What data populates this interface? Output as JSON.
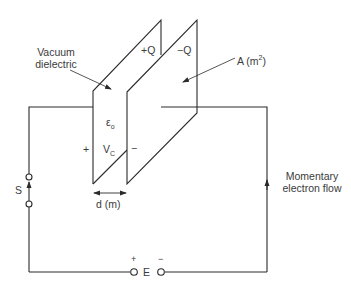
{
  "diagram": {
    "type": "parallel-plate capacitor circuit",
    "labels": {
      "dielectric_line1": "Vacuum",
      "dielectric_line2": "dielectric",
      "plate_pos_charge": "+Q",
      "plate_neg_charge": "−Q",
      "area": "A (m",
      "area_exp": "2",
      "area_close": ")",
      "permittivity": "ε",
      "permittivity_sub": "o",
      "plus_side": "+",
      "voltage": "V",
      "voltage_sub": "C",
      "minus_side": "−",
      "distance": "d (m)",
      "switch": "S",
      "source_plus": "+",
      "source": "E",
      "source_minus": "−",
      "flow_line1": "Momentary",
      "flow_line2": "electron flow"
    },
    "colors": {
      "line": "#2b2b2b",
      "text": "#3a3a3a",
      "background": "#ffffff"
    }
  }
}
